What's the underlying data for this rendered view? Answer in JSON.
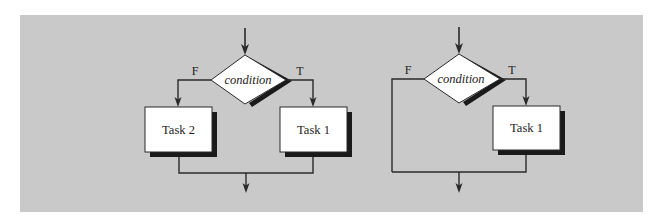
{
  "figure": {
    "background_color": "#ffffff",
    "panel_color": "#c9c9c9",
    "line_color": "#2a2a2a",
    "shadow_color": "#1a1a1a",
    "box_fill": "#ffffff"
  },
  "diagrams": [
    {
      "name": "if-else",
      "condition_label": "condition",
      "false_label": "F",
      "true_label": "T",
      "false_task_label": "Task 2",
      "true_task_label": "Task 1"
    },
    {
      "name": "if-only",
      "condition_label": "condition",
      "false_label": "F",
      "true_label": "T",
      "true_task_label": "Task 1"
    }
  ]
}
